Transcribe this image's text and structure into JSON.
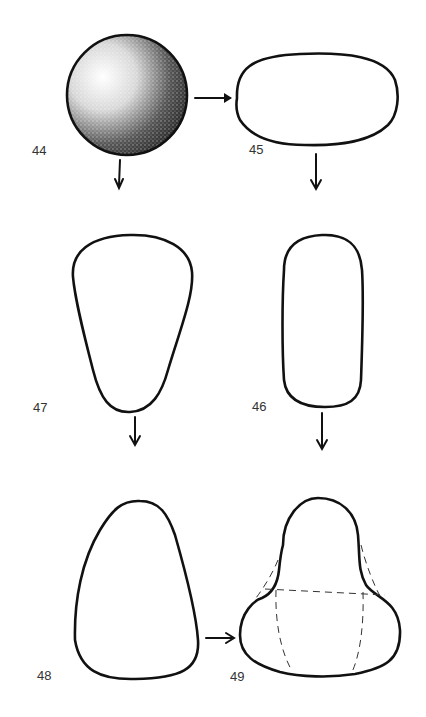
{
  "diagram": {
    "type": "shape-transformation-sequence",
    "figures": [
      {
        "id": "44",
        "label": "44",
        "shape": "sphere (stippled shading)"
      },
      {
        "id": "45",
        "label": "45",
        "shape": "flattened oval"
      },
      {
        "id": "46",
        "label": "46",
        "shape": "elongated rounded rectangle"
      },
      {
        "id": "47",
        "label": "47",
        "shape": "inverted teardrop / tapered"
      },
      {
        "id": "48",
        "label": "48",
        "shape": "pear / cone"
      },
      {
        "id": "49",
        "label": "49",
        "shape": "bell with dashed construction lines"
      }
    ],
    "flow": [
      {
        "from": "44",
        "to": "45",
        "direction": "right"
      },
      {
        "from": "44",
        "to": "47",
        "direction": "down"
      },
      {
        "from": "45",
        "to": "46",
        "direction": "down"
      },
      {
        "from": "47",
        "to": "48",
        "direction": "down"
      },
      {
        "from": "46",
        "to": "49",
        "direction": "down"
      },
      {
        "from": "48",
        "to": "49",
        "direction": "right"
      }
    ],
    "colors": {
      "stroke": "#111111",
      "background": "#ffffff",
      "label": "#333333"
    }
  }
}
